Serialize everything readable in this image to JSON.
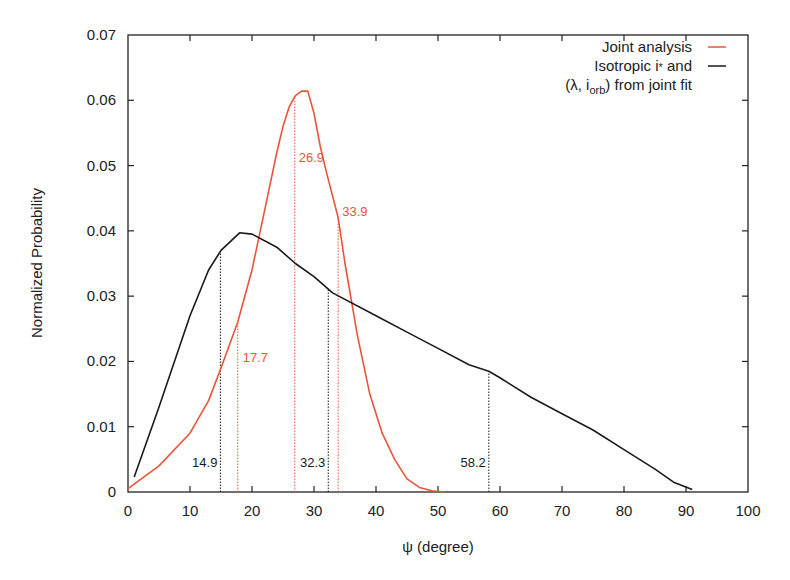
{
  "chart_data": {
    "type": "line",
    "title": "",
    "xlabel": "ψ (degree)",
    "ylabel": "Normalized Probability",
    "xlim": [
      0,
      100
    ],
    "ylim": [
      0,
      0.07
    ],
    "xticks": [
      "0",
      "10",
      "20",
      "30",
      "40",
      "50",
      "60",
      "70",
      "80",
      "90",
      "100"
    ],
    "yticks": [
      "0",
      "0.01",
      "0.02",
      "0.03",
      "0.04",
      "0.05",
      "0.06",
      "0.07"
    ],
    "grid": false,
    "legend_position": "top-right",
    "series": [
      {
        "name": "Joint analysis",
        "color": "#e8553a",
        "x": [
          0,
          5,
          10,
          13,
          15,
          17.7,
          20,
          22,
          24,
          25,
          26,
          27,
          28,
          29,
          30,
          31,
          32,
          33.9,
          35,
          37,
          39,
          41,
          43,
          45,
          47,
          49,
          51
        ],
        "y": [
          0.0005,
          0.004,
          0.009,
          0.014,
          0.019,
          0.026,
          0.034,
          0.043,
          0.052,
          0.056,
          0.059,
          0.0607,
          0.0614,
          0.0614,
          0.058,
          0.053,
          0.049,
          0.042,
          0.035,
          0.024,
          0.015,
          0.009,
          0.005,
          0.002,
          0.0007,
          0.0002,
          0.0
        ]
      },
      {
        "name": "Isotropic i* and (λ, i_orb) from joint fit",
        "color": "#1a1a1a",
        "x": [
          1,
          5,
          10,
          13,
          15,
          18,
          20,
          24,
          27,
          30,
          33,
          40,
          45,
          50,
          55,
          58.2,
          60,
          65,
          70,
          75,
          80,
          85,
          88,
          91
        ],
        "y": [
          0.0023,
          0.013,
          0.027,
          0.034,
          0.037,
          0.0397,
          0.0395,
          0.0375,
          0.035,
          0.033,
          0.0305,
          0.027,
          0.0245,
          0.022,
          0.0195,
          0.0185,
          0.0175,
          0.0145,
          0.012,
          0.0095,
          0.0065,
          0.0035,
          0.0015,
          0.0004
        ]
      }
    ],
    "annotations": [
      {
        "text": "17.7",
        "x": 17.7,
        "color": "#e8553a",
        "series": "Joint analysis"
      },
      {
        "text": "26.9",
        "x": 26.9,
        "color": "#e8553a",
        "series": "Joint analysis"
      },
      {
        "text": "33.9",
        "x": 33.9,
        "color": "#e8553a",
        "series": "Joint analysis"
      },
      {
        "text": "14.9",
        "x": 14.9,
        "color": "#1a1a1a",
        "series": "Isotropic"
      },
      {
        "text": "32.3",
        "x": 32.3,
        "color": "#1a1a1a",
        "series": "Isotropic"
      },
      {
        "text": "58.2",
        "x": 58.2,
        "color": "#1a1a1a",
        "series": "Isotropic"
      }
    ]
  },
  "legend": {
    "line1": "Joint analysis",
    "line2": "Isotropic i",
    "line2_sub": "*",
    "line2_tail": " and",
    "line3_pre": "(λ, i",
    "line3_sub": "orb",
    "line3_tail": ") from joint fit"
  },
  "axes": {
    "xlabel": "ψ (degree)",
    "ylabel": "Normalized Probability"
  }
}
